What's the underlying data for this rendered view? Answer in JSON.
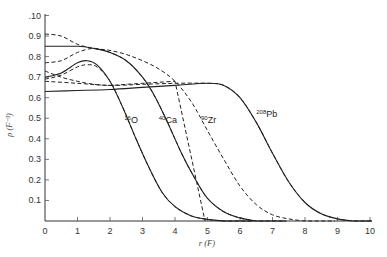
{
  "chart_data": {
    "type": "line",
    "title": "",
    "xlabel": "r (F)",
    "ylabel": "ρ (F⁻³)",
    "xlim": [
      0,
      10
    ],
    "ylim": [
      0,
      0.1
    ],
    "x_ticks": [
      "0",
      "1",
      "2",
      "3",
      "4",
      "5",
      "6",
      "7",
      "8",
      "9",
      "10"
    ],
    "y_ticks": [
      ".10",
      "0.9",
      "0.8",
      "0.7",
      "0.6",
      "0.5",
      "0.4",
      "0.3",
      "0.2",
      "0.1"
    ],
    "grid": false,
    "legend": "inline labels",
    "series": [
      {
        "name": "16O",
        "style": "solid",
        "x": [
          0,
          0.5,
          1,
          1.3,
          1.6,
          2,
          2.4,
          2.8,
          3.2,
          3.6,
          4,
          4.5,
          5,
          5.5
        ],
        "y": [
          0.7,
          0.72,
          0.77,
          0.78,
          0.76,
          0.68,
          0.55,
          0.4,
          0.26,
          0.14,
          0.07,
          0.025,
          0.008,
          0.0
        ]
      },
      {
        "name": "16O (dashed)",
        "style": "dashed",
        "x": [
          0,
          0.5,
          1,
          1.3,
          1.6,
          2,
          2.4,
          2.8,
          3.2,
          3.6,
          4,
          4.5,
          5,
          5.5
        ],
        "y": [
          0.69,
          0.71,
          0.75,
          0.76,
          0.75,
          0.68,
          0.55,
          0.4,
          0.26,
          0.14,
          0.07,
          0.025,
          0.008,
          0.0
        ]
      },
      {
        "name": "40Ca",
        "style": "solid",
        "x": [
          0,
          1,
          1.5,
          2,
          2.5,
          3,
          3.4,
          3.8,
          4.2,
          4.6,
          5,
          5.5,
          6,
          6.5
        ],
        "y": [
          0.85,
          0.85,
          0.84,
          0.82,
          0.78,
          0.7,
          0.6,
          0.47,
          0.33,
          0.21,
          0.11,
          0.045,
          0.015,
          0.0
        ]
      },
      {
        "name": "40Ca (dashed)",
        "style": "dashed",
        "x": [
          0,
          0.5,
          1,
          1.5,
          2,
          2.5,
          3,
          3.4,
          3.8,
          4.2,
          4.6,
          5,
          5.5,
          6,
          6.5
        ],
        "y": [
          0.77,
          0.78,
          0.82,
          0.84,
          0.82,
          0.78,
          0.7,
          0.6,
          0.47,
          0.33,
          0.21,
          0.11,
          0.045,
          0.015,
          0.0
        ]
      },
      {
        "name": "90Zr",
        "style": "dashed",
        "x": [
          0,
          0.5,
          1,
          1.5,
          2,
          2.5,
          3,
          3.5,
          4,
          4.5,
          5,
          5.5,
          6,
          6.5,
          7,
          7.5,
          8
        ],
        "y": [
          0.91,
          0.9,
          0.86,
          0.84,
          0.83,
          0.81,
          0.78,
          0.74,
          0.68,
          0.58,
          0.44,
          0.3,
          0.17,
          0.08,
          0.03,
          0.01,
          0.0
        ]
      },
      {
        "name": "90Zr (dashed inner)",
        "style": "dashed",
        "x": [
          0,
          0.5,
          1,
          1.5,
          2,
          2.5,
          3,
          3.5,
          4
        ],
        "y": [
          0.73,
          0.7,
          0.68,
          0.665,
          0.66,
          0.665,
          0.67,
          0.675,
          0.68
        ]
      },
      {
        "name": "208Pb",
        "style": "solid",
        "x": [
          0,
          1,
          2,
          3,
          4,
          5,
          5.5,
          6,
          6.5,
          7,
          7.5,
          8,
          8.5,
          9,
          9.5
        ],
        "y": [
          0.63,
          0.635,
          0.64,
          0.65,
          0.66,
          0.67,
          0.66,
          0.6,
          0.48,
          0.33,
          0.19,
          0.09,
          0.035,
          0.01,
          0.0
        ]
      },
      {
        "name": "208Pb (dashed)",
        "style": "dashed",
        "x": [
          0,
          1,
          2,
          3,
          4,
          5,
          5.5,
          6,
          6.5,
          7,
          7.5,
          8,
          8.5,
          9,
          9.5
        ],
        "y": [
          0.68,
          0.67,
          0.66,
          0.665,
          0.67,
          0.67,
          0.66,
          0.6,
          0.48,
          0.33,
          0.19,
          0.09,
          0.035,
          0.01,
          0.0
        ]
      }
    ],
    "annotations": [
      {
        "mass": "16",
        "element": "O",
        "x": 2.5,
        "y": 0.42
      },
      {
        "mass": "40",
        "element": "Ca",
        "x": 3.5,
        "y": 0.42
      },
      {
        "mass": "90",
        "element": "Zr",
        "x": 4.8,
        "y": 0.42
      },
      {
        "mass": "208",
        "element": "Pb",
        "x": 6.5,
        "y": 0.45
      }
    ]
  }
}
